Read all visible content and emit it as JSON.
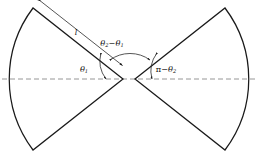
{
  "figure": {
    "background_color": "#ffffff",
    "outline_color": "#1a1a1a",
    "axis_color": "#8a8a8a",
    "annotation_color": "#2b2b2b"
  },
  "axis": {
    "name": "horizontal symmetry axis",
    "style": "dashed",
    "x_start": 2,
    "x_end": 256,
    "y": 79
  },
  "labels": {
    "length": {
      "text": "l",
      "meaning": "sector radius / edge length",
      "x": 76,
      "y": 33
    },
    "theta1": {
      "base": "θ",
      "subscript": "1",
      "text": "θ1",
      "x": 86,
      "y": 70
    },
    "theta_difference": {
      "base1": "θ",
      "subscript1": "2",
      "operator": "−",
      "base2": "θ",
      "subscript2": "1",
      "text": "θ2−θ1",
      "x": 112,
      "y": 44
    },
    "pi_minus_theta2": {
      "pi": "π",
      "operator": "−",
      "base": "θ",
      "subscript": "2",
      "text": "π−θ2",
      "x": 165,
      "y": 70
    }
  },
  "left_sector": {
    "name": "left circular sector",
    "apex_x": 123,
    "apex_y": 79,
    "top_corner_x": 33,
    "top_corner_y": 8,
    "bottom_corner_x": 33,
    "bottom_corner_y": 150,
    "arc_extreme_x": 8,
    "arc_extreme_y": 79
  },
  "right_sector": {
    "name": "right circular sector",
    "apex_x": 135,
    "apex_y": 79,
    "top_corner_x": 225,
    "top_corner_y": 8,
    "bottom_corner_x": 225,
    "bottom_corner_y": 150,
    "arc_extreme_x": 250,
    "arc_extreme_y": 79
  },
  "dimension_arrow": {
    "name": "length dimension arrow",
    "double_headed": true,
    "x_start": 33,
    "y_start": 10,
    "x_end": 119,
    "y_end": 63
  },
  "angle_arcs": [
    {
      "name": "theta1-arc",
      "double_headed": true
    },
    {
      "name": "theta2-minus-theta1-arc",
      "double_headed": true
    },
    {
      "name": "pi-minus-theta2-arc",
      "double_headed": true
    }
  ]
}
